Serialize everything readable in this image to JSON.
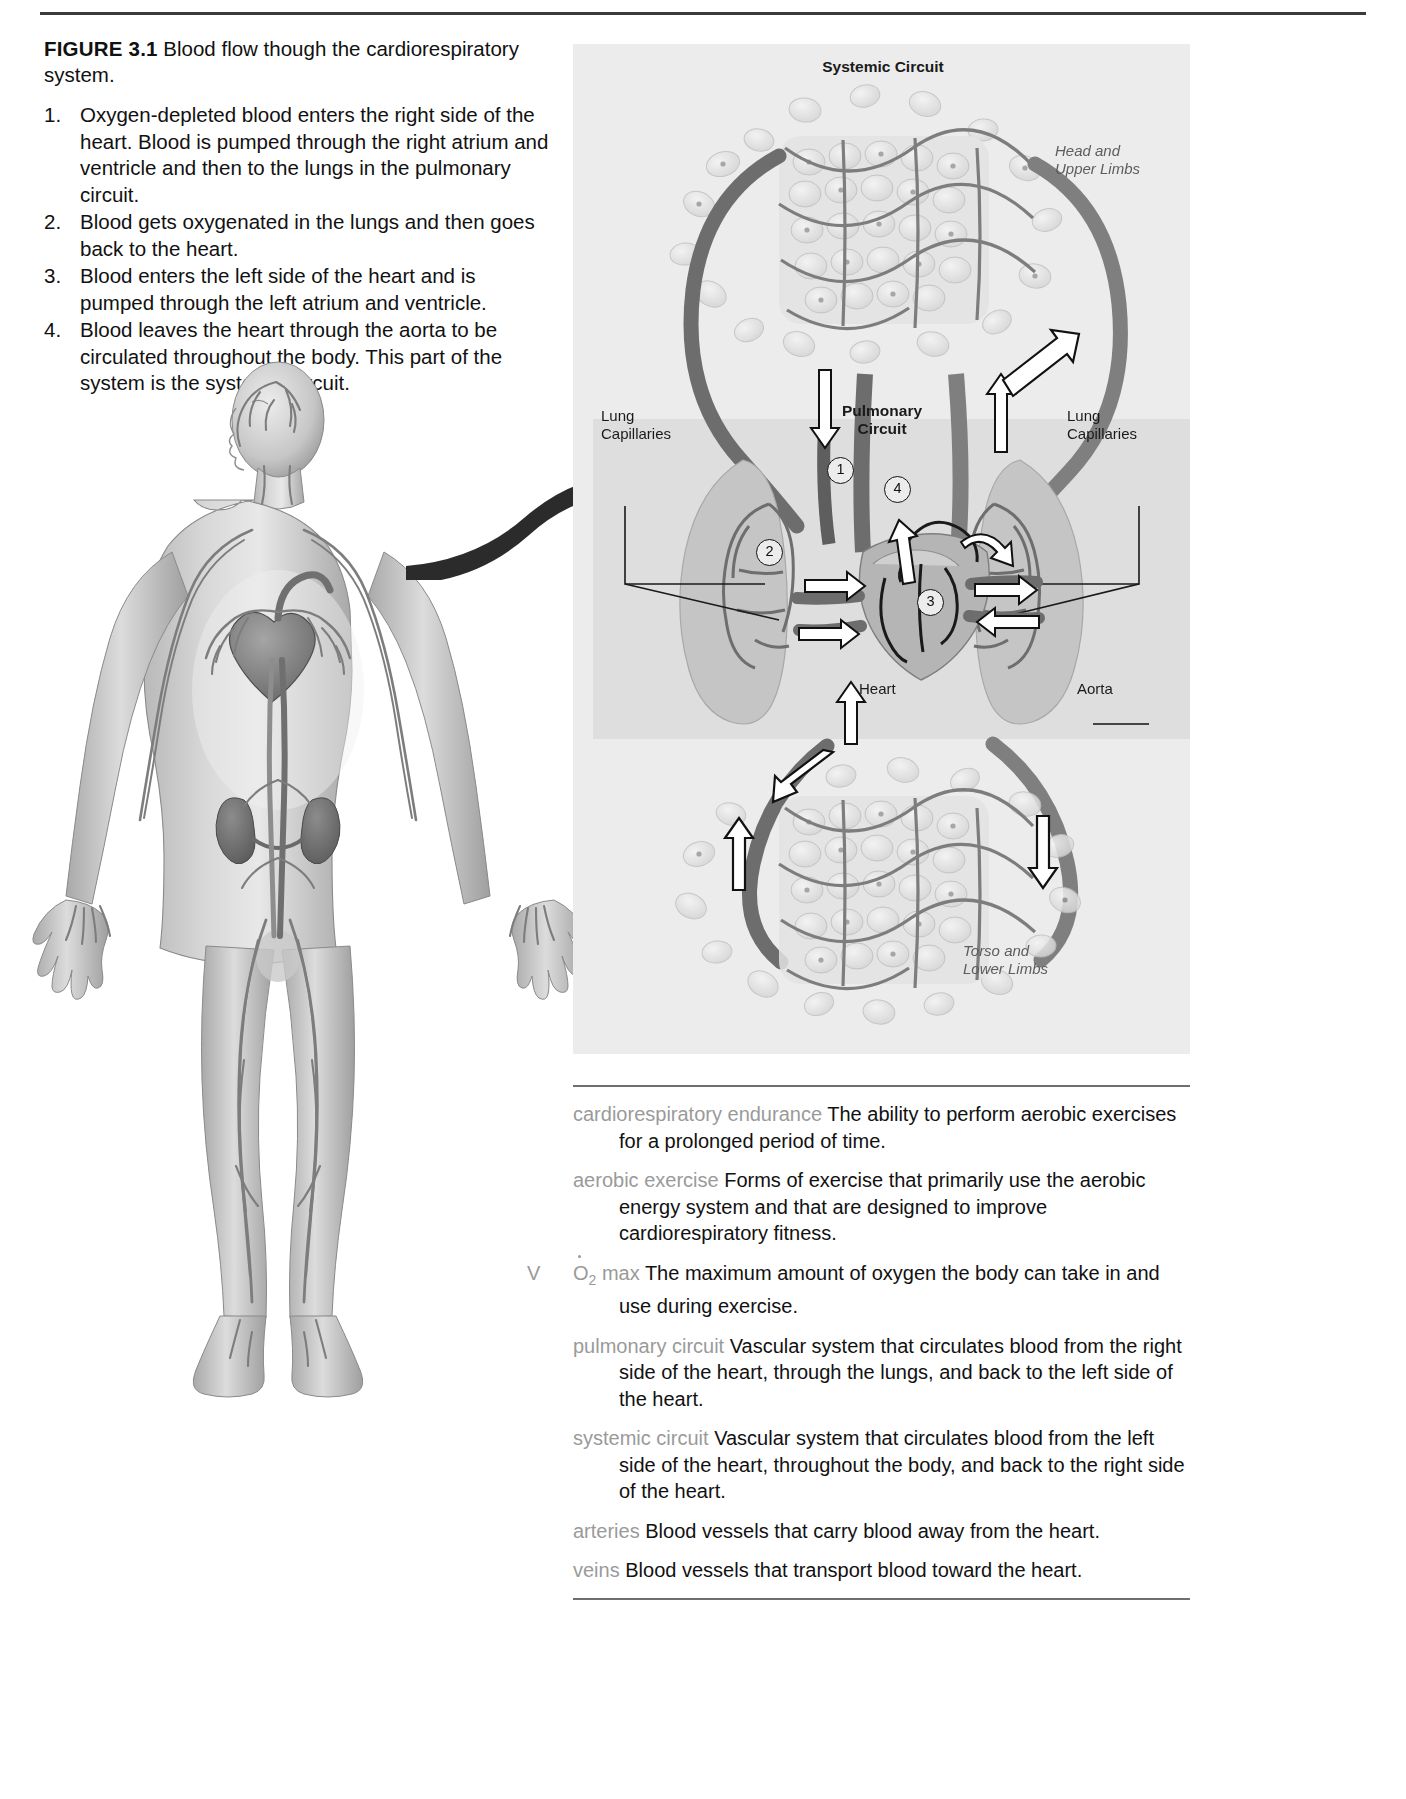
{
  "figure": {
    "label": "FIGURE 3.1",
    "title": "Blood flow though the cardiorespiratory system.",
    "steps": [
      {
        "num": "1.",
        "text": "Oxygen-depleted blood enters the right side of the heart. Blood is pumped through the right atrium and ventricle and then to the lungs in the pulmonary circuit."
      },
      {
        "num": "2.",
        "text": "Blood gets oxygenated in the lungs and then goes back to the heart."
      },
      {
        "num": "3.",
        "text": "Blood enters the left side of the heart and is pumped through the left atrium and ventricle."
      },
      {
        "num": "4.",
        "text": "Blood leaves the heart through the aorta to be circulated throughout the body. This part of the system is the systemic circuit."
      }
    ]
  },
  "diagram": {
    "systemic_title": "Systemic Circuit",
    "pulmonary_title": "Pulmonary\nCircuit",
    "pulmonary_line1": "Pulmonary",
    "pulmonary_line2": "Circuit",
    "head_upper_line1": "Head and",
    "head_upper_line2": "Upper Limbs",
    "torso_lower_line1": "Torso and",
    "torso_lower_line2": "Lower Limbs",
    "lung_cap_left_line1": "Lung",
    "lung_cap_left_line2": "Capillaries",
    "lung_cap_right_line1": "Lung",
    "lung_cap_right_line2": "Capillaries",
    "heart_label": "Heart",
    "aorta_label": "Aorta",
    "markers": [
      "1",
      "2",
      "3",
      "4"
    ]
  },
  "glossary": [
    {
      "term": "cardiorespiratory endurance",
      "definition": "The ability to perform aerobic exercises for a prolonged period of time."
    },
    {
      "term": "aerobic exercise",
      "definition": "Forms of exercise that primarily use the aerobic energy system and that are designed to improve cardiorespiratory fitness."
    },
    {
      "term": "VO2 max",
      "term_special": "vo2max",
      "definition": "The maximum amount of oxygen the body can take in and use during exercise."
    },
    {
      "term": "pulmonary circuit",
      "definition": "Vascular system that circulates blood from the right side of the heart, through the lungs, and back to the left side of the heart."
    },
    {
      "term": "systemic circuit",
      "definition": "Vascular system that circulates blood from the left side of the heart, throughout the body, and back to the right side of the heart."
    },
    {
      "term": "arteries",
      "definition": "Blood vessels that carry blood away from the heart."
    },
    {
      "term": "veins",
      "definition": "Blood vessels that transport blood toward the heart."
    }
  ],
  "colors": {
    "term_gray": "#9a9a9a",
    "panel_bg": "#ececec",
    "band_bg": "#dedede",
    "rule": "#6f6f6f"
  }
}
